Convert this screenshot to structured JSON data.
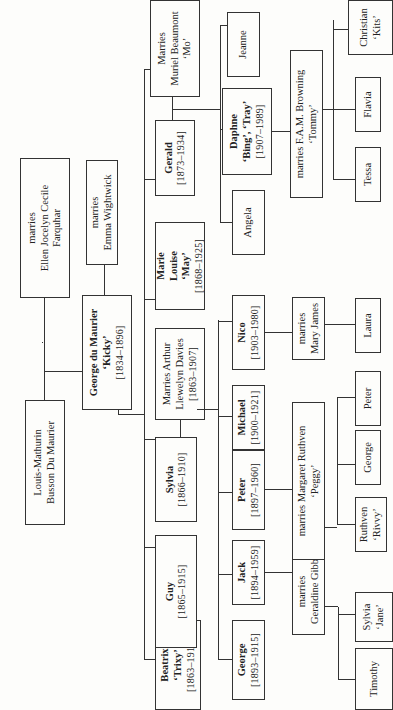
{
  "generation1": {
    "patriarch": {
      "name": "Louis-Mathurin",
      "name2": "Busson Du Maurier"
    },
    "spouse": {
      "line1": "marries",
      "line2": "Ellen Jocelyn Cecile",
      "line3": "Farquhar"
    }
  },
  "generation2": {
    "george": {
      "name": "George du Maurier",
      "nickname": "‘Kicky’",
      "dates": "[1834–1896]"
    },
    "spouse": {
      "line1": "marries",
      "line2": "Emma Wightwick"
    }
  },
  "generation3": {
    "beatrix": {
      "name": "Beatrix",
      "nickname": "‘Trixy’",
      "dates": "[1863–1913]"
    },
    "guy": {
      "name": "Guy",
      "dates": "[1865–1915]"
    },
    "sylvia": {
      "name": "Sylvia",
      "dates": "[1866–1910]"
    },
    "sylvia_spouse": {
      "line1": "Marries Arthur",
      "line2": "Llewelyn Davies",
      "dates": "[1863–1907]"
    },
    "marie_louise": {
      "name1": "Marie",
      "name2": "Louise",
      "nickname": "‘May’",
      "dates": "[1868–1925]"
    },
    "gerald": {
      "name": "Gerald",
      "dates": "[1873–1934]"
    },
    "gerald_spouse": {
      "line1": "Marries",
      "line2": "Muriel Beaumont",
      "line3": "‘Mo’"
    }
  },
  "generation4": {
    "george": {
      "name": "George",
      "dates": "[1893–1915]"
    },
    "jack": {
      "name": "Jack",
      "dates": "[1894–1959]"
    },
    "peter": {
      "name": "Peter",
      "dates": "[1897–1960]"
    },
    "michael": {
      "name": "Michael",
      "dates": "[1900–1921]"
    },
    "nico": {
      "name": "Nico",
      "dates": "[1903–1980]"
    },
    "angela": {
      "name": "Angela"
    },
    "daphne": {
      "name": "Daphne",
      "nickname": "‘Bing’, ‘Tray’",
      "dates": "[1907–1989]"
    },
    "jeanne": {
      "name": "Jeanne"
    }
  },
  "spouses4": {
    "jack_spouse": {
      "line1": "marries",
      "line2": "Geraldine Gibb"
    },
    "peter_spouse": {
      "line1": "marries Margaret Ruthven",
      "line2": "‘Peggy’"
    },
    "nico_spouse": {
      "line1": "marries",
      "line2": "Mary James"
    },
    "daphne_spouse": {
      "line1": "marries F.A.M. Browning",
      "line2": "‘Tommy’"
    }
  },
  "generation5": {
    "timothy": {
      "name": "Timothy"
    },
    "sylvia_jane": {
      "name": "Sylvia",
      "nickname": "‘Jane’"
    },
    "ruthven": {
      "name": "Ruthven",
      "nickname": "‘Rivvy’"
    },
    "george": {
      "name": "George"
    },
    "peter": {
      "name": "Peter"
    },
    "laura": {
      "name": "Laura"
    },
    "tessa": {
      "name": "Tessa"
    },
    "flavia": {
      "name": "Flavia"
    },
    "christian": {
      "name": "Christian",
      "nickname": "‘Kits’"
    }
  }
}
